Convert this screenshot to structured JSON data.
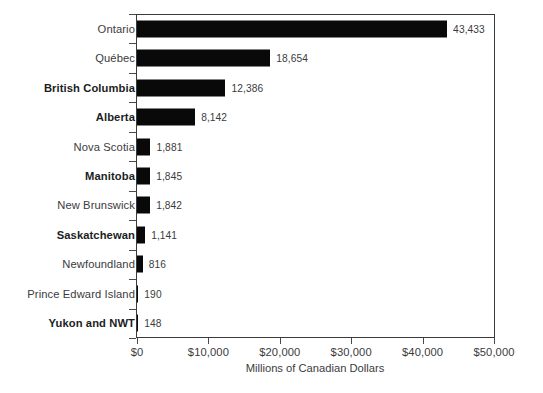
{
  "chart_data": {
    "type": "bar",
    "orientation": "horizontal",
    "title": "",
    "xlabel": "Millions of Canadian Dollars",
    "ylabel": "",
    "xlim": [
      0,
      50000
    ],
    "grid": false,
    "legend": null,
    "xticks": [
      {
        "value": 0,
        "label": "$0"
      },
      {
        "value": 10000,
        "label": "$10,000"
      },
      {
        "value": 20000,
        "label": "$20,000"
      },
      {
        "value": 30000,
        "label": "$30,000"
      },
      {
        "value": 40000,
        "label": "$40,000"
      },
      {
        "value": 50000,
        "label": "$50,000"
      }
    ],
    "categories": [
      "Ontario",
      "Québec",
      "British Columbia",
      "Alberta",
      "Nova Scotia",
      "Manitoba",
      "New Brunswick",
      "Saskatchewan",
      "Newfoundland",
      "Prince Edward Island",
      "Yukon and NWT"
    ],
    "values": [
      43433,
      18654,
      12386,
      8142,
      1881,
      1845,
      1842,
      1141,
      816,
      190,
      148
    ],
    "value_labels": [
      "43,433",
      "18,654",
      "12,386",
      "8,142",
      "1,881",
      "1,845",
      "1,842",
      "1,141",
      "816",
      "190",
      "148"
    ],
    "category_emphasis": [
      false,
      false,
      true,
      true,
      false,
      true,
      false,
      true,
      false,
      false,
      true
    ],
    "bar_color": "#090909",
    "axis_color": "#3a3a3c",
    "text_color": "#3b3b3d",
    "background": "#ffffff"
  }
}
